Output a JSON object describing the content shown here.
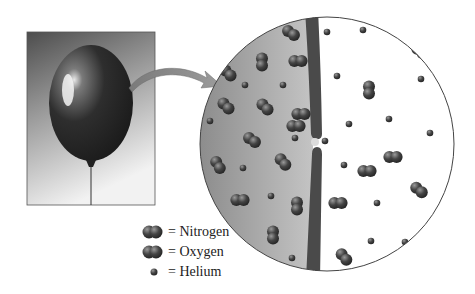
{
  "figure": {
    "colors": {
      "photo_bg_top": "#5a5a5a",
      "photo_bg_bottom": "#ececec",
      "balloon": "#2e2e2e",
      "inside_gas": "#9a9a9a",
      "wall": "#4a4a4a",
      "molecule": "#3f3f3f",
      "outside": "#ffffff",
      "arrow": "#8c8c8c"
    },
    "photo": {
      "x": 27,
      "y": 32,
      "w": 128,
      "h": 173
    },
    "magnifier": {
      "cx": 327,
      "cy": 144,
      "r": 127,
      "wall_x": 313,
      "pore_y": 142
    },
    "nitrogen": [
      [
        291,
        33,
        35
      ],
      [
        262,
        62,
        90
      ],
      [
        298,
        61,
        0
      ],
      [
        228,
        73,
        45
      ],
      [
        265,
        107,
        45
      ],
      [
        226,
        106,
        45
      ],
      [
        301,
        114,
        0
      ],
      [
        252,
        140,
        35
      ],
      [
        218,
        165,
        60
      ],
      [
        283,
        162,
        50
      ],
      [
        240,
        200,
        0
      ],
      [
        297,
        206,
        90
      ],
      [
        273,
        235,
        90
      ],
      [
        420,
        51,
        40
      ],
      [
        369,
        90,
        90
      ],
      [
        393,
        157,
        0
      ],
      [
        419,
        190,
        40
      ],
      [
        338,
        203,
        0
      ],
      [
        344,
        257,
        50
      ],
      [
        296,
        126,
        0
      ],
      [
        367,
        171,
        0
      ]
    ],
    "helium": [
      [
        245,
        85
      ],
      [
        283,
        85
      ],
      [
        210,
        121
      ],
      [
        295,
        138
      ],
      [
        243,
        168
      ],
      [
        271,
        196
      ],
      [
        292,
        258
      ],
      [
        327,
        32
      ],
      [
        363,
        30
      ],
      [
        337,
        76
      ],
      [
        421,
        79
      ],
      [
        349,
        124
      ],
      [
        389,
        119
      ],
      [
        430,
        133
      ],
      [
        325,
        141
      ],
      [
        344,
        165
      ],
      [
        377,
        203
      ],
      [
        371,
        241
      ],
      [
        405,
        242
      ],
      [
        405,
        252
      ]
    ]
  },
  "legend": {
    "items": [
      {
        "key": "nitrogen",
        "label": "= Nitrogen",
        "icon": "diatomic-molecule-icon"
      },
      {
        "key": "oxygen",
        "label": "= Oxygen",
        "icon": "diatomic-molecule-icon"
      },
      {
        "key": "helium",
        "label": "= Helium",
        "icon": "atom-icon"
      }
    ]
  }
}
